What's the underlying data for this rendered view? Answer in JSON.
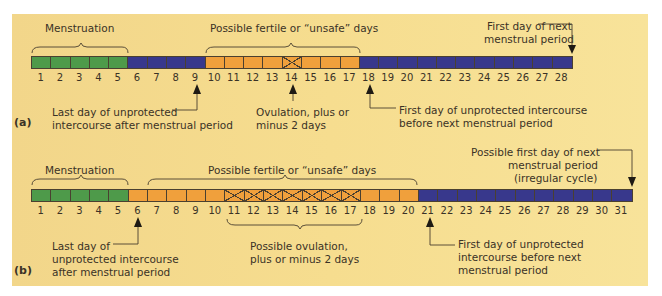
{
  "colors": {
    "menstruation": "#4e9a4a",
    "safe": "#38388c",
    "fertile": "#f0a03c",
    "background": "#f4da8c"
  },
  "chart_a": {
    "tag": "(a)",
    "days": [
      "1",
      "2",
      "3",
      "4",
      "5",
      "6",
      "7",
      "8",
      "9",
      "10",
      "11",
      "12",
      "13",
      "14",
      "15",
      "16",
      "17",
      "18",
      "19",
      "20",
      "21",
      "22",
      "23",
      "24",
      "25",
      "26",
      "27",
      "28"
    ],
    "segments": [
      "green",
      "green",
      "green",
      "green",
      "green",
      "blue",
      "blue",
      "blue",
      "blue",
      "orange",
      "orange",
      "orange",
      "orange",
      "orange-x",
      "orange",
      "orange",
      "orange",
      "blue",
      "blue",
      "blue",
      "blue",
      "blue",
      "blue",
      "blue",
      "blue",
      "blue",
      "blue",
      "blue"
    ],
    "menstruation_label": "Menstruation",
    "fertile_label": "Possible fertile or “unsafe” days",
    "next_period_label_1": "First day of next",
    "next_period_label_2": "menstrual period",
    "last_day_label_1": "Last day of unprotected",
    "last_day_label_2": "intercourse after menstrual period",
    "ovulation_label_1": "Ovulation, plus or",
    "ovulation_label_2": "minus 2 days",
    "first_day_label_1": "First day of unprotected intercourse",
    "first_day_label_2": "before next menstrual period"
  },
  "chart_b": {
    "tag": "(b)",
    "days": [
      "1",
      "2",
      "3",
      "4",
      "5",
      "6",
      "7",
      "8",
      "9",
      "10",
      "11",
      "12",
      "13",
      "14",
      "15",
      "16",
      "17",
      "18",
      "19",
      "20",
      "21",
      "22",
      "23",
      "24",
      "25",
      "26",
      "27",
      "28",
      "29",
      "30",
      "31"
    ],
    "segments": [
      "green",
      "green",
      "green",
      "green",
      "green",
      "orange",
      "orange",
      "orange",
      "orange",
      "orange",
      "orange-x",
      "orange-x",
      "orange-x",
      "orange-x",
      "orange-x",
      "orange-x",
      "orange-x",
      "orange",
      "orange",
      "orange",
      "blue",
      "blue",
      "blue",
      "blue",
      "blue",
      "blue",
      "blue",
      "blue",
      "blue",
      "blue",
      "blue"
    ],
    "menstruation_label": "Menstruation",
    "fertile_label": "Possible fertile or “unsafe” days",
    "next_period_label_1": "Possible first day of next",
    "next_period_label_2": "menstrual period",
    "next_period_label_3": "(irregular cycle)",
    "last_day_label_1": "Last day of",
    "last_day_label_2": "unprotected intercourse",
    "last_day_label_3": "after menstrual period",
    "ovulation_label_1": "Possible ovulation,",
    "ovulation_label_2": "plus or minus 2 days",
    "first_day_label_1": "First day of unprotected",
    "first_day_label_2": "intercourse before next",
    "first_day_label_3": "menstrual period"
  }
}
